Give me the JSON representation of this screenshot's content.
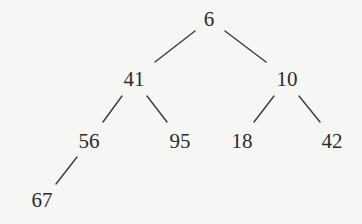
{
  "diagram": {
    "type": "binary-tree",
    "colors": {
      "background": "#f6f6f4",
      "edge": "#3a3a3a",
      "text": "#2b2b2b"
    },
    "nodes": [
      {
        "id": "n6",
        "label": "6",
        "x": 209,
        "y": 19
      },
      {
        "id": "n41",
        "label": "41",
        "x": 134,
        "y": 79
      },
      {
        "id": "n10",
        "label": "10",
        "x": 287,
        "y": 79
      },
      {
        "id": "n56",
        "label": "56",
        "x": 89,
        "y": 141
      },
      {
        "id": "n95",
        "label": "95",
        "x": 180,
        "y": 141
      },
      {
        "id": "n18",
        "label": "18",
        "x": 242,
        "y": 141
      },
      {
        "id": "n42",
        "label": "42",
        "x": 332,
        "y": 141
      },
      {
        "id": "n67",
        "label": "67",
        "x": 42,
        "y": 200
      }
    ],
    "edges": [
      {
        "from": "6",
        "to": "41",
        "x1": 195,
        "y1": 31,
        "x2": 155,
        "y2": 62
      },
      {
        "from": "6",
        "to": "10",
        "x1": 225,
        "y1": 31,
        "x2": 266,
        "y2": 62
      },
      {
        "from": "41",
        "to": "56",
        "x1": 122,
        "y1": 96,
        "x2": 103,
        "y2": 122
      },
      {
        "from": "41",
        "to": "95",
        "x1": 147,
        "y1": 96,
        "x2": 167,
        "y2": 122
      },
      {
        "from": "10",
        "to": "18",
        "x1": 274,
        "y1": 96,
        "x2": 254,
        "y2": 122
      },
      {
        "from": "10",
        "to": "42",
        "x1": 299,
        "y1": 96,
        "x2": 320,
        "y2": 122
      },
      {
        "from": "56",
        "to": "67",
        "x1": 77,
        "y1": 157,
        "x2": 56,
        "y2": 184
      }
    ]
  }
}
